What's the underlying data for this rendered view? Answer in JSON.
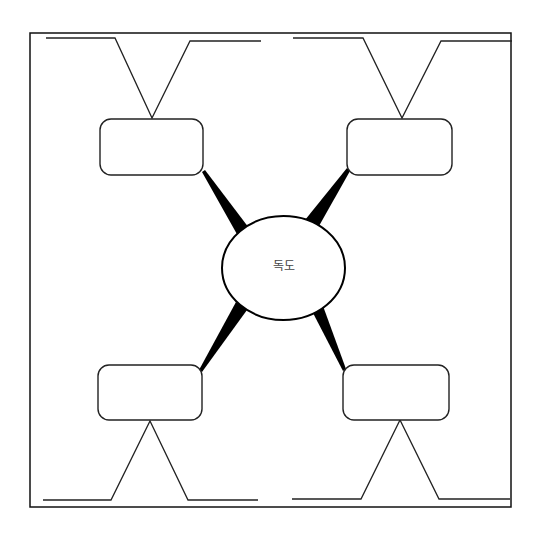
{
  "diagram": {
    "type": "mind-map",
    "center": {
      "label": "독도"
    },
    "branches": [
      {
        "position": "top-left",
        "label": ""
      },
      {
        "position": "top-right",
        "label": ""
      },
      {
        "position": "bottom-left",
        "label": ""
      },
      {
        "position": "bottom-right",
        "label": ""
      }
    ],
    "colors": {
      "stroke": "#111111",
      "background": "#ffffff",
      "text": "#444444"
    }
  }
}
